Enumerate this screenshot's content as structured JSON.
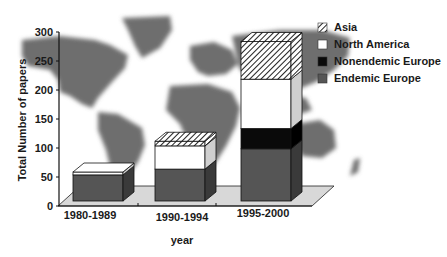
{
  "chart_data": {
    "type": "bar",
    "stacked": true,
    "style": "3d",
    "title": "",
    "xlabel": "year",
    "ylabel": "Total Number of papers",
    "ylim": [
      0,
      300
    ],
    "yticks": [
      0,
      50,
      100,
      150,
      200,
      250,
      300
    ],
    "categories": [
      "1980-1989",
      "1990-1994",
      "1995-2000"
    ],
    "series": [
      {
        "name": "Endemic Europe",
        "values": [
          45,
          55,
          90
        ],
        "color": "#555555",
        "pattern": "solid"
      },
      {
        "name": "Nonendemic Europe",
        "values": [
          0,
          0,
          35
        ],
        "color": "#0a0a0a",
        "pattern": "solid"
      },
      {
        "name": "North America",
        "values": [
          5,
          40,
          85
        ],
        "color": "#ffffff",
        "pattern": "solid"
      },
      {
        "name": "Asia",
        "values": [
          0,
          8,
          65
        ],
        "color": "#ffffff",
        "pattern": "hatched"
      }
    ],
    "legend": {
      "position": "top-right",
      "entries": [
        "Asia",
        "North America",
        "Nonendemic Europe",
        "Endemic Europe"
      ]
    },
    "grid": false,
    "background": "world-map"
  }
}
